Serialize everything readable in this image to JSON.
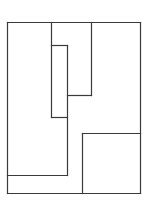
{
  "diagram": {
    "type": "floor-plan-partition",
    "width": 149,
    "height": 209,
    "stroke_color": "#3a3a3a",
    "stroke_width": 1.2,
    "background": "#ffffff",
    "segments": [
      {
        "id": "outer-top",
        "x1": 7,
        "y1": 22,
        "x2": 140,
        "y2": 22
      },
      {
        "id": "outer-left",
        "x1": 7,
        "y1": 22,
        "x2": 7,
        "y2": 193
      },
      {
        "id": "outer-right",
        "x1": 140,
        "y1": 22,
        "x2": 140,
        "y2": 193
      },
      {
        "id": "outer-bottom",
        "x1": 7,
        "y1": 193,
        "x2": 140,
        "y2": 193
      },
      {
        "id": "col-left",
        "x1": 51,
        "y1": 22,
        "x2": 51,
        "y2": 117
      },
      {
        "id": "col-right",
        "x1": 91,
        "y1": 22,
        "x2": 91,
        "y2": 95
      },
      {
        "id": "inner-top",
        "x1": 51,
        "y1": 45,
        "x2": 67,
        "y2": 45
      },
      {
        "id": "inner-right",
        "x1": 67,
        "y1": 45,
        "x2": 67,
        "y2": 175
      },
      {
        "id": "inner-bottom",
        "x1": 51,
        "y1": 117,
        "x2": 67,
        "y2": 117
      },
      {
        "id": "step",
        "x1": 67,
        "y1": 95,
        "x2": 91,
        "y2": 95
      },
      {
        "id": "lower-band",
        "x1": 7,
        "y1": 175,
        "x2": 67,
        "y2": 175
      },
      {
        "id": "square-left",
        "x1": 82,
        "y1": 133,
        "x2": 82,
        "y2": 193
      },
      {
        "id": "square-top",
        "x1": 82,
        "y1": 133,
        "x2": 140,
        "y2": 133
      }
    ]
  }
}
